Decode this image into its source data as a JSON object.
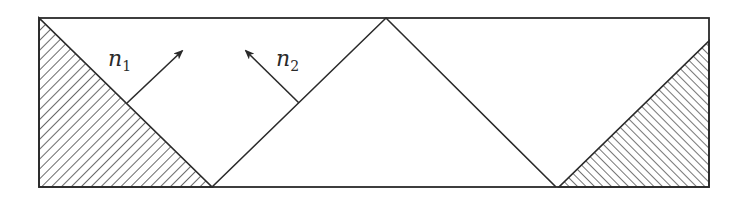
{
  "figure": {
    "width": 750,
    "height": 200,
    "stroke_color": "#2a2a2a",
    "background": "#ffffff",
    "frame": {
      "x1": 39,
      "y1": 18,
      "x2": 709,
      "y2": 187
    },
    "left_hatched_triangle": {
      "points": [
        [
          39,
          18
        ],
        [
          39,
          187
        ],
        [
          212,
          187
        ]
      ],
      "hatch_direction": "backslash"
    },
    "right_hatched_triangle": {
      "points": [
        [
          559,
          187
        ],
        [
          709,
          187
        ],
        [
          709,
          41
        ]
      ],
      "hatch_direction": "slash"
    },
    "zigzag": {
      "points": [
        [
          212,
          187
        ],
        [
          386,
          18
        ],
        [
          556,
          187
        ]
      ]
    },
    "normals": [
      {
        "id": "n1",
        "base": "n",
        "subscript": "1",
        "from": [
          127,
          103
        ],
        "to": [
          182,
          51
        ],
        "label_pos": [
          108,
          62
        ]
      },
      {
        "id": "n2",
        "base": "n",
        "subscript": "2",
        "from": [
          299,
          103
        ],
        "to": [
          246,
          51
        ],
        "label_pos": [
          276,
          62
        ]
      }
    ]
  }
}
